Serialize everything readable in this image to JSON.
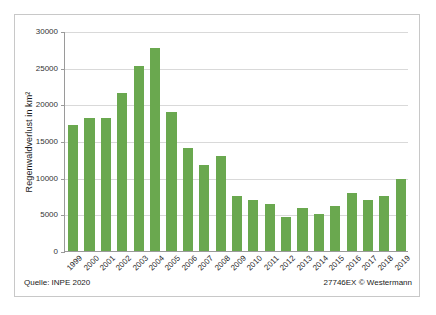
{
  "figure": {
    "source_note": "Quelle: INPE 2020",
    "credit_note": "27746EX © Westermann",
    "bar_color": "#6aa84f",
    "grid_color": "#d9d9d9",
    "axis_color": "#9a9a9a",
    "frame_color": "#c8c8c8"
  },
  "chart_data": {
    "type": "bar",
    "title": "",
    "xlabel": "",
    "ylabel": "Regenwaldverlust in km²",
    "ylim": [
      0,
      30000
    ],
    "yticks": [
      0,
      5000,
      10000,
      15000,
      20000,
      25000,
      30000
    ],
    "ytick_labels": [
      "0",
      "5000",
      "10000",
      "15000",
      "20000",
      "25000",
      "30000"
    ],
    "grid": true,
    "legend": "none",
    "categories": [
      "1999",
      "2000",
      "2001",
      "2002",
      "2003",
      "2004",
      "2005",
      "2006",
      "2007",
      "2008",
      "2009",
      "2010",
      "2011",
      "2012",
      "2013",
      "2014",
      "2015",
      "2016",
      "2017",
      "2018",
      "2019"
    ],
    "values": [
      17200,
      18200,
      18100,
      21600,
      25200,
      27700,
      19000,
      14100,
      11700,
      12900,
      7500,
      7000,
      6400,
      4600,
      5900,
      5000,
      6200,
      7900,
      6900,
      7500,
      9800
    ],
    "series": [
      {
        "name": "Regenwaldverlust",
        "values": [
          17200,
          18200,
          18100,
          21600,
          25200,
          27700,
          19000,
          14100,
          11700,
          12900,
          7500,
          7000,
          6400,
          4600,
          5900,
          5000,
          6200,
          7900,
          6900,
          7500,
          9800
        ]
      }
    ]
  }
}
